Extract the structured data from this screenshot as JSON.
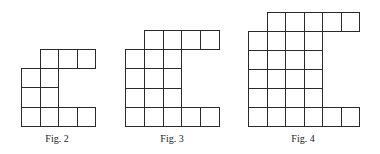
{
  "figures": [
    {
      "caption": "Fig. 2",
      "origin": [
        21,
        49
      ],
      "cell": [
        18.5,
        19.2
      ],
      "rows": [
        {
          "start": 1,
          "count": 3
        },
        {
          "start": 0,
          "count": 2
        },
        {
          "start": 0,
          "count": 2
        },
        {
          "start": 0,
          "count": 4
        }
      ],
      "caption_center": [
        57,
        139
      ]
    },
    {
      "caption": "Fig. 3",
      "origin": [
        125,
        30
      ],
      "cell": [
        18.8,
        19.2
      ],
      "rows": [
        {
          "start": 1,
          "count": 4
        },
        {
          "start": 0,
          "count": 3
        },
        {
          "start": 0,
          "count": 3
        },
        {
          "start": 0,
          "count": 3
        },
        {
          "start": 0,
          "count": 5
        }
      ],
      "caption_center": [
        172,
        139
      ]
    },
    {
      "caption": "Fig. 4",
      "origin": [
        248,
        12
      ],
      "cell": [
        18.5,
        19
      ],
      "rows": [
        {
          "start": 1,
          "count": 5
        },
        {
          "start": 0,
          "count": 4
        },
        {
          "start": 0,
          "count": 4
        },
        {
          "start": 0,
          "count": 4
        },
        {
          "start": 0,
          "count": 4
        },
        {
          "start": 0,
          "count": 6
        }
      ],
      "caption_center": [
        303,
        139
      ]
    }
  ]
}
